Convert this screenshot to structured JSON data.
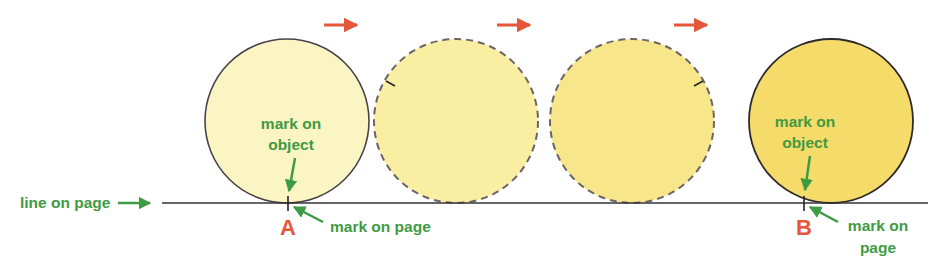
{
  "colors": {
    "label_green": "#3f9a44",
    "arrow_orange": "#e4573a",
    "letter_red": "#e4573a",
    "circle1_fill": "#fbf5c4",
    "circle2_fill": "#faeea2",
    "circle3_fill": "#f8e68a",
    "circle4_fill": "#f5dc6a",
    "outline": "#4a4248",
    "dashed_outline": "#6c6466",
    "line": "#333333"
  },
  "labels": {
    "line_on_page": "line on page",
    "mark_on_object_1a": "mark on",
    "mark_on_object_1b": "object",
    "mark_on_object_2a": "mark on",
    "mark_on_object_2b": "object",
    "mark_on_page_a": "mark on page",
    "mark_on_page_b1": "mark on",
    "mark_on_page_b2": "page",
    "point_a": "A",
    "point_b": "B"
  },
  "motion_arrows": [
    {
      "x": 324,
      "y": 25
    },
    {
      "x": 497,
      "y": 25
    },
    {
      "x": 674,
      "y": 25
    }
  ],
  "circles": [
    {
      "cx": 287,
      "cy": 121,
      "r": 82,
      "style": "solid"
    },
    {
      "cx": 456,
      "cy": 121,
      "r": 82,
      "style": "dashed"
    },
    {
      "cx": 632,
      "cy": 121,
      "r": 82,
      "style": "dashed"
    },
    {
      "cx": 831,
      "cy": 121,
      "r": 82,
      "style": "solid"
    }
  ]
}
